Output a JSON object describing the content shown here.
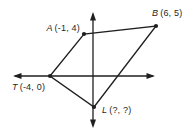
{
  "figure": {
    "points": {
      "A": {
        "name": "A",
        "coords": "(-1, 4)"
      },
      "B": {
        "name": "B",
        "coords": "(6, 5)"
      },
      "T": {
        "name": "T",
        "coords": "(-4, 0)"
      },
      "L": {
        "name": "L",
        "coords": "(?, ?)"
      }
    },
    "colors": {
      "line": "#1f1f1f",
      "background": "#ffffff"
    }
  }
}
